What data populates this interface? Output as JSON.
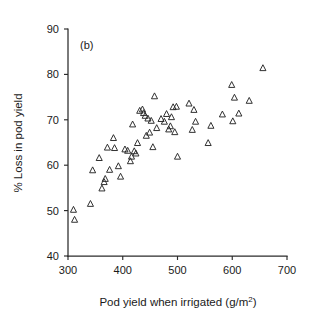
{
  "figure": {
    "panel_label": "(b)",
    "background_color": "#ffffff",
    "ink_color": "#262626"
  },
  "chart_data": {
    "type": "scatter",
    "title": "",
    "panel": "(b)",
    "xlabel": "Pod yield when irrigated (g/m²)",
    "xlabel_base": "Pod yield when irrigated (g/m",
    "xlabel_sup": "2",
    "xlabel_tail": ")",
    "ylabel": "% Loss in pod yield",
    "xlim": [
      300,
      700
    ],
    "ylim": [
      40,
      90
    ],
    "xticks": [
      300,
      400,
      500,
      600,
      700
    ],
    "yticks": [
      40,
      50,
      60,
      70,
      80,
      90
    ],
    "xtick_labels": [
      "300",
      "400",
      "500",
      "600",
      "700"
    ],
    "ytick_labels": [
      "40",
      "50",
      "60",
      "70",
      "80",
      "90"
    ],
    "grid": false,
    "legend": null,
    "marker": "triangle-up-open",
    "marker_color": "#262626",
    "series": [
      {
        "name": "Pod yield loss",
        "points": [
          [
            310,
            50.2
          ],
          [
            312,
            48.0
          ],
          [
            341,
            51.5
          ],
          [
            345,
            58.9
          ],
          [
            362,
            54.9
          ],
          [
            366,
            56.3
          ],
          [
            368,
            57.0
          ],
          [
            357,
            61.6
          ],
          [
            372,
            63.9
          ],
          [
            376,
            59.0
          ],
          [
            383,
            66.0
          ],
          [
            385,
            63.8
          ],
          [
            392,
            59.8
          ],
          [
            396,
            57.5
          ],
          [
            404,
            63.5
          ],
          [
            409,
            63.2
          ],
          [
            414,
            60.9
          ],
          [
            416,
            61.9
          ],
          [
            418,
            69.0
          ],
          [
            421,
            63.1
          ],
          [
            424,
            62.6
          ],
          [
            427,
            64.9
          ],
          [
            431,
            72.0
          ],
          [
            436,
            72.3
          ],
          [
            438,
            71.5
          ],
          [
            441,
            70.9
          ],
          [
            443,
            66.5
          ],
          [
            446,
            70.3
          ],
          [
            449,
            67.2
          ],
          [
            452,
            69.8
          ],
          [
            455,
            64.0
          ],
          [
            458,
            75.2
          ],
          [
            462,
            68.2
          ],
          [
            470,
            70.2
          ],
          [
            476,
            69.6
          ],
          [
            480,
            71.3
          ],
          [
            484,
            67.9
          ],
          [
            487,
            68.6
          ],
          [
            489,
            70.6
          ],
          [
            492,
            72.8
          ],
          [
            495,
            67.3
          ],
          [
            498,
            72.9
          ],
          [
            500,
            61.9
          ],
          [
            521,
            73.6
          ],
          [
            527,
            67.8
          ],
          [
            530,
            72.2
          ],
          [
            533,
            69.6
          ],
          [
            556,
            64.9
          ],
          [
            561,
            68.7
          ],
          [
            582,
            71.2
          ],
          [
            599,
            77.7
          ],
          [
            601,
            69.7
          ],
          [
            604,
            74.9
          ],
          [
            612,
            71.4
          ],
          [
            631,
            74.2
          ],
          [
            656,
            81.4
          ]
        ]
      }
    ]
  }
}
